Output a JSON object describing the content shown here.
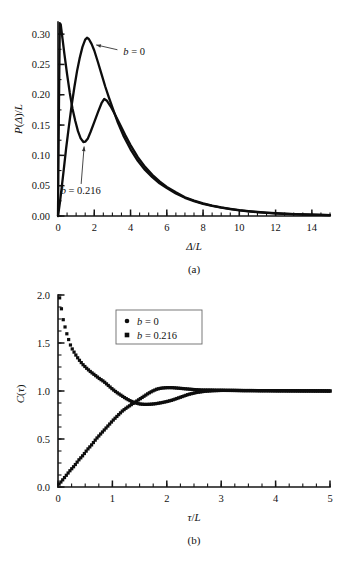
{
  "figure": {
    "background": "#ffffff",
    "ink_color": "#0d0d0d",
    "panel_a_caption": "(a)",
    "panel_b_caption": "(b)"
  },
  "chart_data": [
    {
      "id": "panel-a",
      "type": "line",
      "title": "",
      "subtitle": "",
      "caption": "(a)",
      "xlabel": "Δ/L",
      "ylabel": "P(Δ)/L",
      "xlim": [
        0,
        15
      ],
      "ylim": [
        0.0,
        0.32
      ],
      "grid": false,
      "legend": "none",
      "xticks": [
        0,
        2,
        4,
        6,
        8,
        10,
        12,
        14
      ],
      "xticklabels": [
        "0",
        "2",
        "4",
        "6",
        "8",
        "10",
        "12",
        "14"
      ],
      "xtick_minor_step": 0.5,
      "yticks": [
        0.0,
        0.05,
        0.1,
        0.15,
        0.2,
        0.25,
        0.3
      ],
      "yticklabels": [
        "0.00",
        "0.05",
        "0.10",
        "0.15",
        "0.20",
        "0.25",
        "0.30"
      ],
      "ytick_minor_step": 0.025,
      "annotations": [
        {
          "name": "b-zero-label",
          "text": "b = 0",
          "italic_head": "b",
          "rest": " = 0",
          "x": 3.6,
          "y": 0.272,
          "arrow_to_x": 2.0,
          "arrow_to_y": 0.283
        },
        {
          "name": "b-0216-label",
          "text": "b = 0.216",
          "italic_head": "b",
          "rest": " = 0.216",
          "x": 1.25,
          "y": 0.043,
          "arrow_to_x": 1.45,
          "arrow_to_y": 0.118
        }
      ],
      "series": [
        {
          "name": "b = 0",
          "label": "b = 0",
          "marker": "none",
          "comment": "Broad single-humped distribution peaking near 1.6",
          "x": [
            0.0,
            0.1,
            0.2,
            0.3,
            0.45,
            0.6,
            0.75,
            0.9,
            1.05,
            1.2,
            1.35,
            1.5,
            1.6,
            1.7,
            1.85,
            2.0,
            2.2,
            2.4,
            2.6,
            2.8,
            3.0,
            3.3,
            3.6,
            4.0,
            4.4,
            4.8,
            5.2,
            5.6,
            6.0,
            6.5,
            7.0,
            7.5,
            8.0,
            8.5,
            9.0,
            9.5,
            10.0,
            10.5,
            11.0,
            11.5,
            12.0,
            12.5,
            13.0,
            13.5,
            14.0,
            14.5,
            15.0
          ],
          "y": [
            0.0,
            0.021,
            0.046,
            0.072,
            0.112,
            0.148,
            0.182,
            0.212,
            0.239,
            0.261,
            0.279,
            0.291,
            0.294,
            0.292,
            0.284,
            0.273,
            0.254,
            0.234,
            0.214,
            0.196,
            0.179,
            0.154,
            0.133,
            0.11,
            0.091,
            0.076,
            0.064,
            0.054,
            0.046,
            0.037,
            0.03,
            0.0245,
            0.0201,
            0.0166,
            0.0137,
            0.0114,
            0.0094,
            0.0078,
            0.0064,
            0.0053,
            0.0044,
            0.0036,
            0.003,
            0.0025,
            0.0021,
            0.0017,
            0.0014
          ]
        },
        {
          "name": "b = 0.216",
          "label": "b = 0.216",
          "marker": "none",
          "comment": "Bimodal: sharp spike at the origin, dip near 1.4, secondary peak near 2.55",
          "x": [
            0.0,
            0.05,
            0.1,
            0.15,
            0.25,
            0.35,
            0.5,
            0.65,
            0.8,
            0.95,
            1.1,
            1.25,
            1.4,
            1.5,
            1.65,
            1.8,
            2.0,
            2.2,
            2.4,
            2.55,
            2.7,
            2.9,
            3.1,
            3.4,
            3.7,
            4.0,
            4.4,
            4.8,
            5.2,
            5.6,
            6.0,
            6.5,
            7.0,
            7.5,
            8.0,
            8.5,
            9.0,
            9.5,
            10.0,
            10.5,
            11.0,
            11.5,
            12.0,
            12.5,
            13.0,
            13.5,
            14.0,
            14.5,
            15.0
          ],
          "y": [
            0.0,
            0.175,
            0.318,
            0.316,
            0.292,
            0.268,
            0.234,
            0.203,
            0.177,
            0.157,
            0.14,
            0.128,
            0.122,
            0.1225,
            0.128,
            0.139,
            0.155,
            0.171,
            0.186,
            0.193,
            0.19,
            0.181,
            0.17,
            0.152,
            0.134,
            0.117,
            0.097,
            0.081,
            0.068,
            0.057,
            0.048,
            0.039,
            0.031,
            0.0255,
            0.0209,
            0.0172,
            0.0142,
            0.0118,
            0.0097,
            0.008,
            0.0066,
            0.0055,
            0.0045,
            0.0037,
            0.0031,
            0.0026,
            0.0021,
            0.0018,
            0.0015
          ]
        }
      ]
    },
    {
      "id": "panel-b",
      "type": "scatter",
      "title": "",
      "subtitle": "",
      "caption": "(b)",
      "xlabel": "τ/L",
      "ylabel": "C(τ)",
      "xlim": [
        0,
        5
      ],
      "ylim": [
        0.0,
        2.0
      ],
      "grid": false,
      "legend": "inside-upper-left",
      "legend_entries": [
        {
          "marker": "circle",
          "label": "b = 0",
          "italic_head": "b",
          "rest": " = 0"
        },
        {
          "marker": "square",
          "label": "b = 0.216",
          "italic_head": "b",
          "rest": " = 0.216"
        }
      ],
      "xticks": [
        0,
        1,
        2,
        3,
        4,
        5
      ],
      "xticklabels": [
        "0",
        "1",
        "2",
        "3",
        "4",
        "5"
      ],
      "xtick_minor_step": 0.25,
      "yticks": [
        0.0,
        0.5,
        1.0,
        1.5,
        2.0
      ],
      "yticklabels": [
        "0.0",
        "0.5",
        "1.0",
        "1.5",
        "2.0"
      ],
      "ytick_minor_step": 0.125,
      "series": [
        {
          "name": "b = 0",
          "label": "b = 0",
          "marker": "circle",
          "comment": "Rises monotonically from 0 toward the plateau at 1.0, slight overshoot near 2.0",
          "x": [
            0.02,
            0.08,
            0.15,
            0.22,
            0.3,
            0.38,
            0.46,
            0.54,
            0.62,
            0.7,
            0.78,
            0.86,
            0.94,
            1.02,
            1.1,
            1.18,
            1.26,
            1.34,
            1.42,
            1.5,
            1.58,
            1.66,
            1.74,
            1.82,
            1.9,
            2.0,
            2.1,
            2.2,
            2.3,
            2.4,
            2.5,
            2.65,
            2.8,
            2.95,
            3.1,
            3.25,
            3.4,
            3.55,
            3.7,
            3.85,
            4.0,
            4.15,
            4.3,
            4.45,
            4.6,
            4.75,
            4.9,
            5.0
          ],
          "y": [
            0.03,
            0.07,
            0.12,
            0.17,
            0.22,
            0.28,
            0.33,
            0.39,
            0.44,
            0.5,
            0.55,
            0.6,
            0.65,
            0.7,
            0.745,
            0.79,
            0.825,
            0.855,
            0.885,
            0.915,
            0.945,
            0.975,
            1.0,
            1.02,
            1.03,
            1.035,
            1.035,
            1.03,
            1.025,
            1.02,
            1.015,
            1.01,
            1.01,
            1.008,
            1.006,
            1.006,
            1.005,
            1.005,
            1.004,
            1.004,
            1.003,
            1.003,
            1.002,
            1.002,
            1.002,
            1.001,
            1.001,
            1.0
          ]
        },
        {
          "name": "b = 0.216",
          "label": "b = 0.216",
          "marker": "square",
          "comment": "Starts near 2.0, decays to a shallow minimum near 1.5 then settles at 1.0",
          "x": [
            0.03,
            0.1,
            0.17,
            0.24,
            0.31,
            0.38,
            0.45,
            0.52,
            0.6,
            0.68,
            0.76,
            0.84,
            0.92,
            1.0,
            1.08,
            1.16,
            1.24,
            1.32,
            1.4,
            1.5,
            1.6,
            1.7,
            1.8,
            1.9,
            2.0,
            2.1,
            2.2,
            2.3,
            2.4,
            2.55,
            2.7,
            2.85,
            3.0,
            3.15,
            3.3,
            3.45,
            3.6,
            3.75,
            3.9,
            4.05,
            4.2,
            4.35,
            4.5,
            4.65,
            4.8,
            4.95,
            5.0
          ],
          "y": [
            1.97,
            1.73,
            1.58,
            1.46,
            1.39,
            1.33,
            1.28,
            1.24,
            1.2,
            1.165,
            1.13,
            1.1,
            1.06,
            1.02,
            0.985,
            0.955,
            0.925,
            0.9,
            0.88,
            0.865,
            0.86,
            0.862,
            0.868,
            0.878,
            0.89,
            0.905,
            0.925,
            0.945,
            0.965,
            0.985,
            0.997,
            1.003,
            1.006,
            1.006,
            1.005,
            1.004,
            1.004,
            1.003,
            1.003,
            1.002,
            1.002,
            1.002,
            1.001,
            1.001,
            1.001,
            1.0,
            1.0
          ]
        }
      ]
    }
  ]
}
